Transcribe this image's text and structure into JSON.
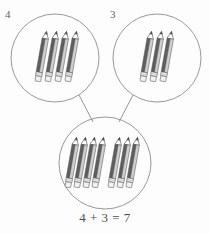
{
  "labels": {
    "left_group_count": "4",
    "right_group_count": "3"
  },
  "equation": {
    "text": "4 + 3 = 7",
    "addend_one": 4,
    "addend_two": 3,
    "sum": 7
  },
  "groups": {
    "left": {
      "name": "left-pencil-group",
      "count": 4,
      "circle": {
        "cx": 55,
        "cy": 58,
        "r": 44
      }
    },
    "right": {
      "name": "right-pencil-group",
      "count": 3,
      "circle": {
        "cx": 157,
        "cy": 58,
        "r": 44
      }
    },
    "total": {
      "name": "total-pencil-group",
      "count": 7,
      "left_subgroup": 4,
      "right_subgroup": 3,
      "circle": {
        "cx": 105,
        "cy": 163,
        "r": 46
      }
    }
  },
  "colors": {
    "stroke": "#8c8c8c",
    "pencil_body_dark": "#5a5a5a",
    "pencil_body_light": "#d8d8d8",
    "pencil_outline": "#555555",
    "ferrule": "#e8e8e8",
    "text": "#4d4d4d",
    "background": "#fdfdfd"
  },
  "icons": {
    "pencil": "pencil-icon",
    "circle": "group-circle-icon",
    "connector": "connector-line-icon"
  }
}
